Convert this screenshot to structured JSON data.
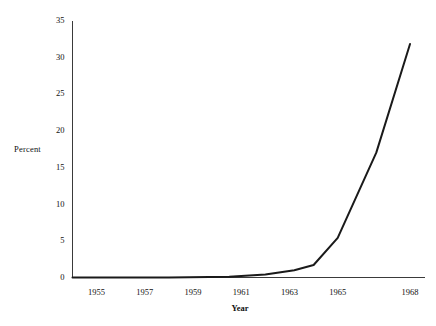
{
  "chart_data": {
    "type": "line",
    "title": "",
    "xlabel": "Year",
    "ylabel": "Percent",
    "xlim": [
      1954,
      1968.6
    ],
    "ylim": [
      0,
      35
    ],
    "grid": false,
    "legend": null,
    "x_tick_labels": [
      "1955",
      "1957",
      "1959",
      "1961",
      "1963",
      "1965",
      "1968"
    ],
    "x_tick_values": [
      1955,
      1957,
      1959,
      1961,
      1963,
      1965,
      1968
    ],
    "y_tick_labels": [
      "0",
      "5",
      "10",
      "15",
      "20",
      "25",
      "30",
      "35"
    ],
    "y_tick_values": [
      0,
      5,
      10,
      15,
      20,
      25,
      30,
      35
    ],
    "series": [
      {
        "name": "Percent",
        "color": "#1a1a1a",
        "x": [
          1954.0,
          1958.0,
          1960.5,
          1962.0,
          1963.2,
          1964.0,
          1965.0,
          1966.6,
          1968.0
        ],
        "values": [
          0.0,
          0.0,
          0.1,
          0.4,
          1.0,
          1.7,
          5.4,
          17.0,
          31.8
        ]
      }
    ]
  },
  "axes": {
    "y_axis_title": "Percent",
    "x_axis_title": "Year"
  }
}
